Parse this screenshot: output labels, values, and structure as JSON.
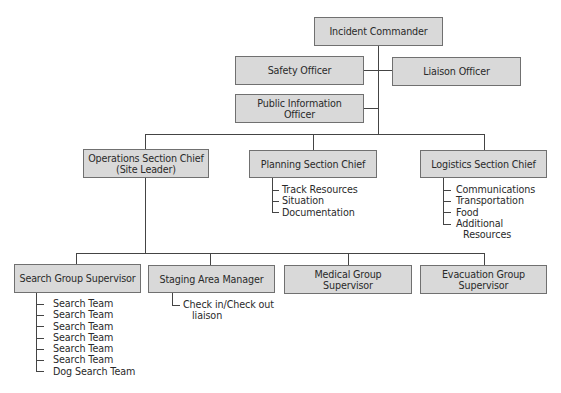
{
  "chart": {
    "nodes": {
      "incident_commander": "Incident Commander",
      "safety_officer": "Safety Officer",
      "liaison_officer": "Liaison Officer",
      "pio_line1": "Public Information",
      "pio_line2": "Officer",
      "operations_line1": "Operations Section Chief",
      "operations_line2": "(Site Leader)",
      "planning": "Planning Section Chief",
      "logistics": "Logistics Section Chief",
      "search_group": "Search Group Supervisor",
      "staging": "Staging Area Manager",
      "medical_line1": "Medical Group",
      "medical_line2": "Supervisor",
      "evacuation_line1": "Evacuation Group",
      "evacuation_line2": "Supervisor"
    },
    "planning_items": [
      "Track Resources",
      "Situation",
      "Documentation"
    ],
    "logistics_items": [
      "Communications",
      "Transportation",
      "Food",
      "Additional",
      "Resources"
    ],
    "staging_items": [
      "Check in/Check out",
      "liaison"
    ],
    "search_items": [
      "Search Team",
      "Search Team",
      "Search Team",
      "Search Team",
      "Search Team",
      "Search Team",
      "Dog Search Team"
    ],
    "colors": {
      "box_fill": "#d9d9d9",
      "box_border": "#707070",
      "line": "#444444"
    }
  }
}
